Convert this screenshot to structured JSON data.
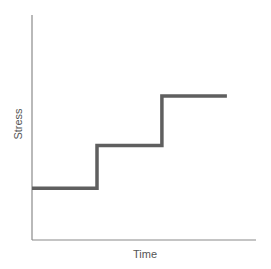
{
  "chart_data": {
    "type": "line",
    "subtype": "step",
    "title": "",
    "xlabel": "Time",
    "ylabel": "Stress",
    "grid": false,
    "legend": null,
    "ticks": {
      "x": [],
      "y": []
    },
    "series": [
      {
        "name": "Stress",
        "color": "#5f5f5f",
        "points": [
          {
            "x": 0.0,
            "y": 0.23
          },
          {
            "x": 0.29,
            "y": 0.23
          },
          {
            "x": 0.29,
            "y": 0.42
          },
          {
            "x": 0.58,
            "y": 0.42
          },
          {
            "x": 0.58,
            "y": 0.64
          },
          {
            "x": 0.87,
            "y": 0.64
          }
        ]
      }
    ],
    "xlim": [
      0,
      1
    ],
    "ylim": [
      0,
      1
    ]
  },
  "plot": {
    "left": 32,
    "right": 256,
    "top": 15,
    "bottom": 240
  },
  "axis_color": "#8a8a8a",
  "label_color": "#555555"
}
